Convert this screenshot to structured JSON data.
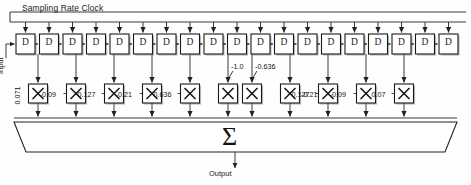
{
  "figure": {
    "title_label": "Sampling Rate Clock",
    "input_label": "Input",
    "output_label": "Output",
    "sum_symbol": "Σ",
    "delay_element_label": "D",
    "multiplier_symbol": "×",
    "delay_count": 19,
    "multiplier_count": 11
  },
  "colors": {
    "line": "#333333",
    "box_stroke": "#1a1a1a",
    "box_fill": "#ffffff",
    "shadow": "#888888",
    "text": "#111111",
    "background": "#fefefe"
  },
  "taps": [
    {
      "index": 0,
      "coefficient": "0.071",
      "label_style": "vertical",
      "x": 38
    },
    {
      "index": 1,
      "coefficient": "-0.09",
      "label_style": "left",
      "x": 76
    },
    {
      "index": 2,
      "coefficient": "0.127",
      "label_style": "left",
      "x": 114
    },
    {
      "index": 3,
      "coefficient": "-0.21",
      "label_style": "left",
      "x": 152
    },
    {
      "index": 4,
      "coefficient": "0.636",
      "label_style": "left",
      "x": 190
    },
    {
      "index": 5,
      "coefficient": "-1.0",
      "label_style": "leader",
      "x": 228
    },
    {
      "index": 6,
      "coefficient": "-0.636",
      "label_style": "leader",
      "x": 252
    },
    {
      "index": 7,
      "coefficient": "-0.21",
      "label_style": "right",
      "x": 290
    },
    {
      "index": 8,
      "coefficient": "0.127",
      "label_style": "left",
      "x": 328
    },
    {
      "index": 9,
      "coefficient": "-0.09",
      "label_style": "left",
      "x": 366
    },
    {
      "index": 10,
      "coefficient": "0.07",
      "label_style": "left",
      "x": 404
    }
  ],
  "chart_data": {
    "type": "bar",
    "xlabel": "Tap index",
    "ylabel": "Coefficient",
    "categories": [
      "0",
      "1",
      "2",
      "3",
      "4",
      "5",
      "6",
      "7",
      "8",
      "9",
      "10"
    ],
    "values": [
      0.071,
      -0.09,
      0.127,
      -0.21,
      0.636,
      -1.0,
      -0.636,
      -0.21,
      0.127,
      -0.09,
      0.07
    ],
    "ylim": [
      -1.0,
      0.7
    ],
    "grid": false,
    "legend": "none"
  }
}
